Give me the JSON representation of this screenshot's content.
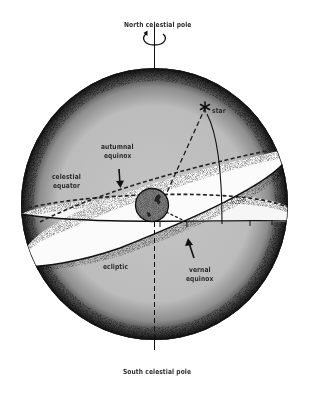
{
  "diagram": {
    "labels": {
      "north_pole": "North celestial pole",
      "south_pole": "South celestial pole",
      "star": "star",
      "autumnal_equinox_line1": "autumnal",
      "autumnal_equinox_line2": "equinox",
      "celestial_equator_line1": "celestial",
      "celestial_equator_line2": "equator",
      "ecliptic": "ecliptic",
      "vernal_equinox_line1": "vernal",
      "vernal_equinox_line2": "equinox"
    },
    "colors": {
      "sphere_fill": "#bdbdbd",
      "band_fill": "#ffffff",
      "earth_fill": "#7a7a7a",
      "ink": "#111111",
      "background": "#ffffff"
    },
    "icons": {
      "rotation_arrow": "rotation-arrow-icon",
      "star_marker": "star-icon",
      "earth": "earth-icon"
    }
  }
}
